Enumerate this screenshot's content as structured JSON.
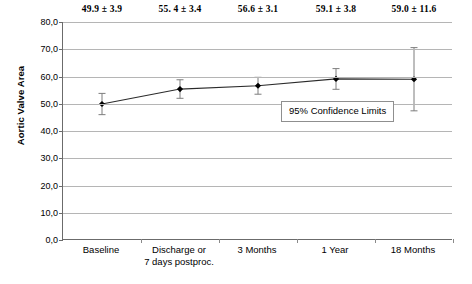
{
  "chart_data": {
    "type": "line",
    "title": "",
    "xlabel": "",
    "ylabel": "Aortic Valve Area",
    "ylim": [
      0,
      80
    ],
    "ystep": 10,
    "grid": true,
    "legend_position": "inside-right",
    "categories": [
      "Baseline",
      "Discharge or\n7 days postproc.",
      "3 Months",
      "1 Year",
      "18 Months"
    ],
    "category_lines": [
      [
        "Baseline"
      ],
      [
        "Discharge or",
        "7 days postproc."
      ],
      [
        "3 Months"
      ],
      [
        "1 Year"
      ],
      [
        "18 Months"
      ]
    ],
    "values": [
      49.9,
      55.4,
      56.6,
      59.1,
      59.0
    ],
    "errors": [
      3.9,
      3.4,
      3.1,
      3.8,
      11.6
    ],
    "point_labels": [
      "49.9 ± 3.9",
      "55. 4 ± 3.4",
      "56.6 ± 3.1",
      "59.1 ± 3.8",
      "59.0 ± 11.6"
    ],
    "ytick_labels": [
      "0,0",
      "10,0",
      "20,0",
      "30,0",
      "40,0",
      "50,0",
      "60,0",
      "70,0",
      "80,0"
    ],
    "ytick_values": [
      0,
      10,
      20,
      30,
      40,
      50,
      60,
      70,
      80
    ],
    "annotations": [
      {
        "name": "confidence-legend",
        "text": "95% Confidence Limits"
      }
    ],
    "series": [
      {
        "name": "Aortic Valve Area",
        "values": [
          49.9,
          55.4,
          56.6,
          59.1,
          59.0
        ],
        "errors": [
          3.9,
          3.4,
          3.1,
          3.8,
          11.6
        ],
        "marker": "diamond",
        "color": "#1a1a1a"
      }
    ]
  },
  "colors": {
    "line": "#2b2b2b",
    "marker": "#000000",
    "errorbar": "#7d7d7d",
    "grid": "#b5b5b5",
    "axis": "#6b6b6b",
    "background": "#ffffff",
    "text": "#000000"
  }
}
